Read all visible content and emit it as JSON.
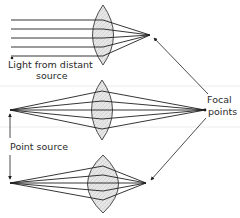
{
  "diagram": {
    "labels": {
      "light_line1": "Light from distant",
      "light_line2": "source",
      "focal_line1": "Focal",
      "focal_line2": "points",
      "point_source": "Point source"
    },
    "panels": [
      {
        "name": "parallel-rays",
        "source": "distant",
        "lens_center": [
          103,
          35
        ],
        "focal_point": [
          150,
          35
        ],
        "ray_y": [
          20,
          29,
          38,
          47,
          56
        ]
      },
      {
        "name": "point-source-thin-lens",
        "source": [
          10,
          110
        ],
        "lens_center": [
          102,
          110
        ],
        "focal_point": [
          205,
          110
        ]
      },
      {
        "name": "point-source-thick-lens",
        "source": [
          10,
          183
        ],
        "lens_center": [
          103,
          183
        ],
        "focal_point": [
          146,
          183
        ]
      }
    ],
    "colors": {
      "line": "#1f1f1f",
      "lens_fill": "#e4e4e4",
      "lens_stroke": "#3a3a3a",
      "artifact_band": "#ececec"
    }
  }
}
